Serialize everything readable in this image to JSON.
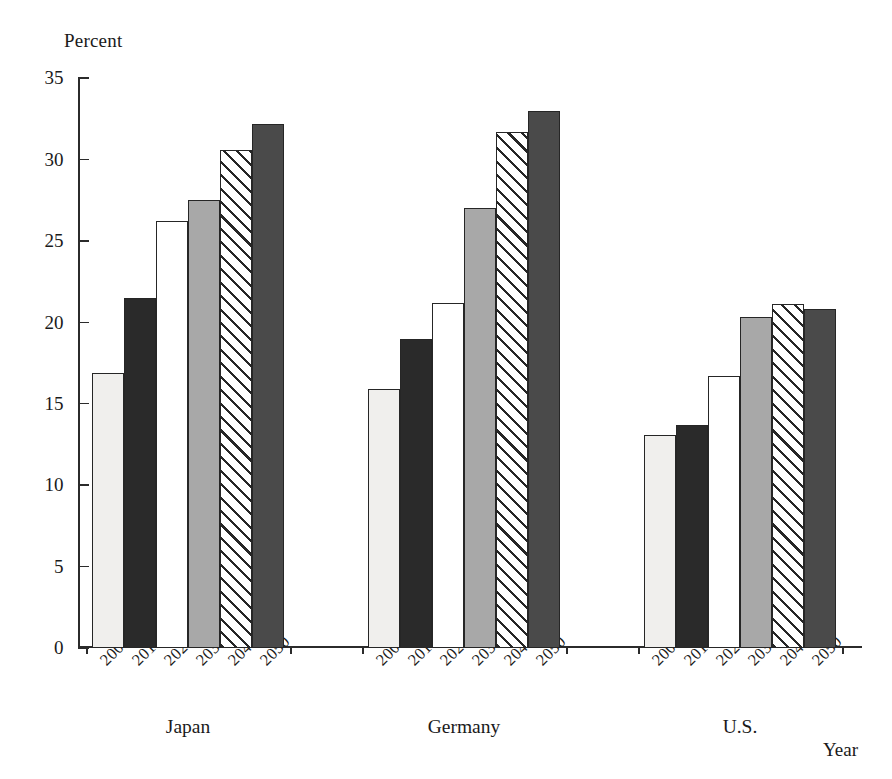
{
  "chart_data": {
    "type": "bar",
    "title": "",
    "subtitle": "",
    "ylabel": "Percent",
    "xlabel": "Year",
    "ylim": [
      0,
      35
    ],
    "yticks": [
      0,
      5,
      10,
      15,
      20,
      25,
      30,
      35
    ],
    "ytick_labels": [
      "0",
      "5",
      "10",
      "15",
      "20",
      "25",
      "30",
      "35"
    ],
    "grid": false,
    "legend": "none",
    "categories": [
      "2000",
      "2010",
      "2020",
      "2030",
      "2040",
      "2050"
    ],
    "groups": [
      "Japan",
      "Germany",
      "U.S."
    ],
    "series": [
      {
        "name": "Japan",
        "values": [
          16.9,
          21.5,
          26.2,
          27.5,
          30.6,
          32.2
        ]
      },
      {
        "name": "Germany",
        "values": [
          15.9,
          19.0,
          21.2,
          27.0,
          31.7,
          33.0
        ]
      },
      {
        "name": "U.S.",
        "values": [
          13.1,
          13.7,
          16.7,
          20.3,
          21.1,
          20.8
        ]
      }
    ],
    "bar_fills": [
      "light-gray",
      "black",
      "white",
      "gray",
      "diagonal-hatch",
      "dark-gray"
    ],
    "colors": {
      "light_gray": "#f0efed",
      "black": "#2a2a2a",
      "white": "#ffffff",
      "gray": "#a8a8a8",
      "hatch_line": "#262626",
      "dark_gray": "#4a4a4a",
      "axis": "#2b2b2b",
      "bar_outline": "#262626",
      "background": "#ffffff"
    }
  }
}
